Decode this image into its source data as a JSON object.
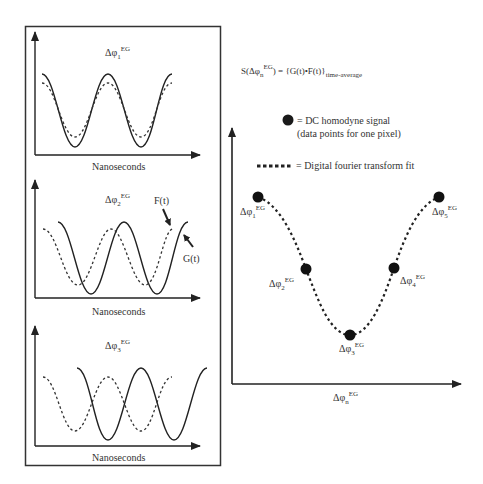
{
  "left_panels": {
    "frame": true,
    "panels": [
      {
        "title": "Δφ",
        "title_sub": "1",
        "title_sup": "EG",
        "xlabel": "Nanoseconds",
        "phase_relation": "in phase",
        "curves": [
          {
            "name": "G(t)",
            "style": "solid"
          },
          {
            "name": "F(t)",
            "style": "dashed"
          }
        ]
      },
      {
        "title": "Δφ",
        "title_sub": "2",
        "title_sup": "EG",
        "xlabel": "Nanoseconds",
        "phase_relation": "quarter-period shift",
        "annotations": [
          {
            "text": "F(t)",
            "target": "dashed curve"
          },
          {
            "text": "G(t)",
            "target": "solid curve"
          }
        ]
      },
      {
        "title": "Δφ",
        "title_sub": "3",
        "title_sup": "EG",
        "xlabel": "Nanoseconds",
        "phase_relation": "half-period shift (anti-phase)"
      }
    ]
  },
  "formula": {
    "prefix": "S(Δφ",
    "sub": "n",
    "sup": "EG",
    "middle": ") = {G(t)•F(t)}",
    "subscript_end": "time-average"
  },
  "legend": {
    "dot_label_line1": "= DC homodyne signal",
    "dot_label_line2": "(data points for one pixel)",
    "dash_label": "= Digital fourier transform fit"
  },
  "right_chart": {
    "xlabel": "Δφ",
    "xlabel_sub": "n",
    "xlabel_sup": "EG",
    "points": [
      {
        "label": "Δφ",
        "sub": "1",
        "sup": "EG",
        "x": 258,
        "y": 197
      },
      {
        "label": "Δφ",
        "sub": "2",
        "sup": "EG",
        "x": 306,
        "y": 269
      },
      {
        "label": "Δφ",
        "sub": "3",
        "sup": "EG",
        "x": 350,
        "y": 335
      },
      {
        "label": "Δφ",
        "sub": "4",
        "sup": "EG",
        "x": 394,
        "y": 268
      },
      {
        "label": "Δφ",
        "sub": "5",
        "sup": "EG",
        "x": 439,
        "y": 197
      }
    ]
  },
  "colors": {
    "ink": "#222222",
    "text": "#333333"
  }
}
